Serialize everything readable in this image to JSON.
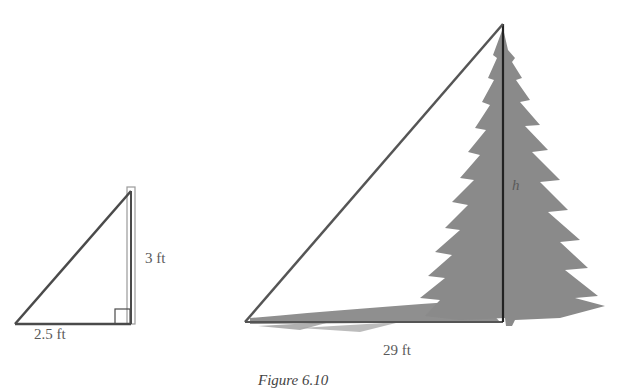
{
  "figure": {
    "caption": "Figure 6.10",
    "small_triangle": {
      "base_label": "2.5 ft",
      "height_label": "3 ft",
      "right_angle_marker": true
    },
    "large_triangle": {
      "base_label": "29 ft",
      "height_label": "h",
      "object": "pine-tree"
    }
  },
  "colors": {
    "line": "#4a4a4a",
    "tree": "#8a8a8a",
    "text": "#5a5a5a"
  }
}
